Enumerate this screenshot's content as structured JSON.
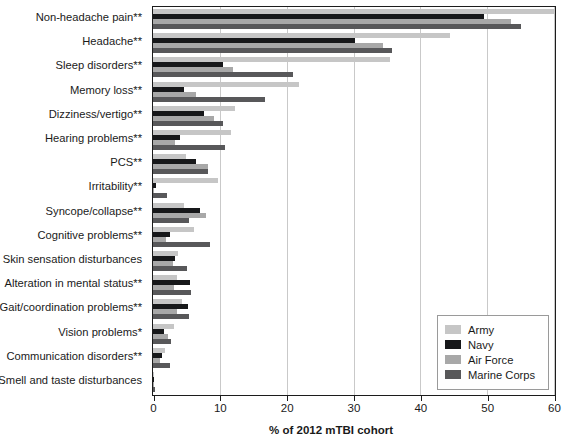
{
  "chart_data": {
    "type": "bar",
    "orientation": "horizontal",
    "title": "",
    "xlabel": "% of 2012 mTBI cohort",
    "ylabel": "",
    "xlim": [
      0,
      60
    ],
    "xticks": [
      0,
      10,
      20,
      30,
      40,
      50,
      60
    ],
    "grid": "vertical",
    "legend_position": "bottom-right",
    "categories": [
      "Non-headache pain**",
      "Headache**",
      "Sleep disorders**",
      "Memory loss**",
      "Dizziness/vertigo**",
      "Hearing problems**",
      "PCS**",
      "Irritability**",
      "Syncope/collapse**",
      "Cognitive problems**",
      "Skin sensation disturbances",
      "Alteration in mental status**",
      "Gait/coordination problems**",
      "Vision problems*",
      "Communication disorders**",
      "Smell and taste disturbances"
    ],
    "series": [
      {
        "name": "Army",
        "color": "#c6c6c6",
        "values": [
          60.0,
          44.5,
          35.5,
          21.8,
          12.2,
          11.6,
          5.0,
          9.8,
          4.6,
          6.2,
          3.7,
          3.6,
          4.4,
          3.2,
          1.8,
          0.2
        ]
      },
      {
        "name": "Navy",
        "color": "#17181a",
        "values": [
          49.5,
          30.2,
          10.5,
          4.6,
          7.7,
          4.0,
          6.5,
          0.4,
          7.0,
          2.5,
          3.3,
          5.5,
          5.2,
          1.6,
          1.3,
          0.2
        ]
      },
      {
        "name": "Air Force",
        "color": "#a8a8a8",
        "values": [
          53.5,
          34.4,
          12.0,
          6.4,
          9.1,
          3.3,
          8.2,
          0.2,
          7.9,
          1.9,
          3.0,
          3.2,
          3.6,
          2.2,
          1.1,
          0.2
        ]
      },
      {
        "name": "Marine Corps",
        "color": "#58585a",
        "values": [
          55.0,
          35.7,
          20.9,
          16.7,
          10.4,
          10.7,
          8.2,
          2.1,
          5.4,
          8.5,
          5.1,
          5.7,
          5.4,
          2.7,
          2.6,
          0.3
        ]
      }
    ]
  },
  "legend": {
    "items": [
      {
        "label": "Army",
        "color": "#c6c6c6"
      },
      {
        "label": "Navy",
        "color": "#17181a"
      },
      {
        "label": "Air Force",
        "color": "#a8a8a8"
      },
      {
        "label": "Marine Corps",
        "color": "#58585a"
      }
    ]
  },
  "axis": {
    "x_title": "% of 2012 mTBI cohort",
    "x_tick_labels": [
      "0",
      "10",
      "20",
      "30",
      "40",
      "50",
      "60"
    ]
  }
}
